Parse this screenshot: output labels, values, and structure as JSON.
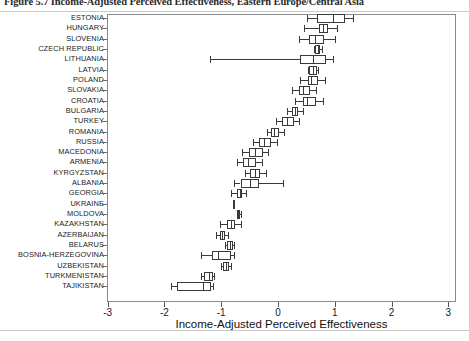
{
  "figure": {
    "caption": "Figure 5.7  Income-Adjusted Perceived Effectiveness, Eastern Europe/Central Asia"
  },
  "chart_data": {
    "type": "box",
    "title": "",
    "xlabel": "Income-Adjusted Perceived Effectiveness",
    "ylabel": "",
    "xlim": [
      -3,
      3
    ],
    "xticks": [
      -3,
      -2,
      -1,
      0,
      1,
      2,
      3
    ],
    "xticklabels": [
      "-3",
      "-2",
      "-1",
      "0",
      "1",
      "2",
      "3"
    ],
    "grid": false,
    "legend": null,
    "orientation": "horizontal",
    "categories": [
      "ESTONIA",
      "HUNGARY",
      "SLOVENIA",
      "CZECH REPUBLIC",
      "LITHUANIA",
      "LATVIA",
      "POLAND",
      "SLOVAKIA",
      "CROATIA",
      "BULGARIA",
      "TURKEY",
      "ROMANIA",
      "RUSSIA",
      "MACEDONIA",
      "ARMENIA",
      "KYRGYZSTAN",
      "ALBANIA",
      "GEORGIA",
      "UKRAINE",
      "MOLDOVA",
      "KAZAKHSTAN",
      "AZERBAIJAN",
      "BELARUS",
      "BOSNIA-HERZEGOVINA",
      "UZBEKISTAN",
      "TURKMENISTAN",
      "TAJIKISTAN"
    ],
    "boxes": [
      {
        "category": "ESTONIA",
        "whisker_low": 0.51,
        "q1": 0.69,
        "median": 0.97,
        "q3": 1.18,
        "whisker_high": 1.32
      },
      {
        "category": "HUNGARY",
        "whisker_low": 0.46,
        "q1": 0.72,
        "median": 0.79,
        "q3": 0.88,
        "whisker_high": 1.04
      },
      {
        "category": "SLOVENIA",
        "whisker_low": 0.37,
        "q1": 0.55,
        "median": 0.65,
        "q3": 0.81,
        "whisker_high": 1.0
      },
      {
        "category": "CZECH REPUBLIC",
        "whisker_low": 0.63,
        "q1": 0.66,
        "median": 0.7,
        "q3": 0.74,
        "whisker_high": 0.78
      },
      {
        "category": "LITHUANIA",
        "whisker_low": -1.19,
        "q1": 0.39,
        "median": 0.62,
        "q3": 0.85,
        "whisker_high": 0.96
      },
      {
        "category": "LATVIA",
        "whisker_low": 0.53,
        "q1": 0.55,
        "median": 0.62,
        "q3": 0.69,
        "whisker_high": 0.71
      },
      {
        "category": "POLAND",
        "whisker_low": 0.39,
        "q1": 0.52,
        "median": 0.58,
        "q3": 0.7,
        "whisker_high": 0.83
      },
      {
        "category": "SLOVAKIA",
        "whisker_low": 0.25,
        "q1": 0.37,
        "median": 0.44,
        "q3": 0.56,
        "whisker_high": 0.67
      },
      {
        "category": "CROATIA",
        "whisker_low": 0.3,
        "q1": 0.44,
        "median": 0.51,
        "q3": 0.67,
        "whisker_high": 0.79
      },
      {
        "category": "BULGARIA",
        "whisker_low": 0.16,
        "q1": 0.25,
        "median": 0.3,
        "q3": 0.36,
        "whisker_high": 0.44
      },
      {
        "category": "TURKEY",
        "whisker_low": -0.04,
        "q1": 0.07,
        "median": 0.16,
        "q3": 0.28,
        "whisker_high": 0.37
      },
      {
        "category": "ROMANIA",
        "whisker_low": -0.2,
        "q1": -0.13,
        "median": -0.07,
        "q3": 0.02,
        "whisker_high": 0.11
      },
      {
        "category": "RUSSIA",
        "whisker_low": -0.44,
        "q1": -0.34,
        "median": -0.25,
        "q3": -0.12,
        "whisker_high": -0.02
      },
      {
        "category": "MACEDONIA",
        "whisker_low": -0.64,
        "q1": -0.51,
        "median": -0.4,
        "q3": -0.27,
        "whisker_high": -0.18
      },
      {
        "category": "ARMENIA",
        "whisker_low": -0.72,
        "q1": -0.62,
        "median": -0.53,
        "q3": -0.39,
        "whisker_high": -0.28
      },
      {
        "category": "KYRGYZSTAN",
        "whisker_low": -0.58,
        "q1": -0.49,
        "median": -0.41,
        "q3": -0.31,
        "whisker_high": -0.22
      },
      {
        "category": "ALBANIA",
        "whisker_low": -0.77,
        "q1": -0.66,
        "median": -0.5,
        "q3": -0.33,
        "whisker_high": 0.09
      },
      {
        "category": "GEORGIA",
        "whisker_low": -0.83,
        "q1": -0.72,
        "median": -0.67,
        "q3": -0.63,
        "whisker_high": -0.56
      },
      {
        "category": "UKRAINE",
        "whisker_low": -0.79,
        "q1": -0.79,
        "median": -0.79,
        "q3": -0.79,
        "whisker_high": -0.79
      },
      {
        "category": "MOLDOVA",
        "whisker_low": -0.73,
        "q1": -0.72,
        "median": -0.7,
        "q3": -0.67,
        "whisker_high": -0.66
      },
      {
        "category": "KAZAKHSTAN",
        "whisker_low": -1.02,
        "q1": -0.9,
        "median": -0.83,
        "q3": -0.76,
        "whisker_high": -0.66
      },
      {
        "category": "AZERBAIJAN",
        "whisker_low": -1.09,
        "q1": -1.02,
        "median": -0.98,
        "q3": -0.93,
        "whisker_high": -0.88
      },
      {
        "category": "BELARUS",
        "whisker_low": -0.93,
        "q1": -0.9,
        "median": -0.85,
        "q3": -0.8,
        "whisker_high": -0.77
      },
      {
        "category": "BOSNIA-HERZEGOVINA",
        "whisker_low": -1.36,
        "q1": -1.17,
        "median": -1.05,
        "q3": -0.83,
        "whisker_high": -0.77
      },
      {
        "category": "UZBEKISTAN",
        "whisker_low": -1.01,
        "q1": -0.96,
        "median": -0.92,
        "q3": -0.87,
        "whisker_high": -0.83
      },
      {
        "category": "TURKMENISTAN",
        "whisker_low": -1.35,
        "q1": -1.31,
        "median": -1.22,
        "q3": -1.15,
        "whisker_high": -1.13
      },
      {
        "category": "TAJIKISTAN",
        "whisker_low": -1.89,
        "q1": -1.78,
        "median": -1.32,
        "q3": -1.18,
        "whisker_high": -1.15
      }
    ]
  }
}
